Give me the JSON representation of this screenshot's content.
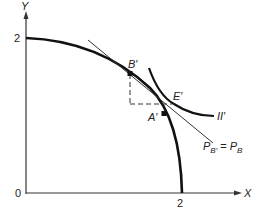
{
  "axes": {
    "y_label": "Y",
    "x_label": "X",
    "origin_label": "0",
    "y_tick_label": "2",
    "x_tick_label": "2"
  },
  "points": {
    "b_prime": "B′",
    "a_prime": "A′",
    "e_prime": "E′"
  },
  "curves": {
    "indifference_label": "II′",
    "price_line_label": {
      "p": "P",
      "sub_left": "B′",
      "equals": " = ",
      "sub_right": "B"
    }
  },
  "colors": {
    "ink": "#1a1a1a",
    "background": "#ffffff"
  }
}
